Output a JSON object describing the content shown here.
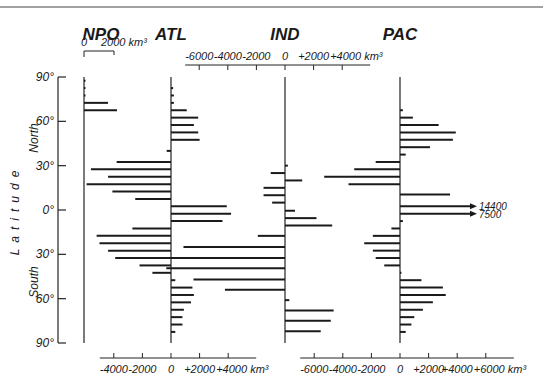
{
  "chart_data": {
    "type": "bar",
    "orientation": "horizontal",
    "title": "",
    "ylabel": "Latitude",
    "ylabel_parts": {
      "north": "North",
      "south": "South"
    },
    "unit": "km³",
    "latitude_ticks": [
      "90°",
      "60°",
      "30°",
      "0°",
      "30°",
      "60°",
      "90°"
    ],
    "latitude_tick_values": [
      90,
      60,
      30,
      0,
      -30,
      -60,
      -90
    ],
    "panels": [
      {
        "name": "NPO",
        "axis_position": "top",
        "axis_ticks": [
          "0",
          "2000 km³"
        ],
        "xlim": [
          0,
          2000
        ],
        "bars": [
          {
            "lat": 87.5,
            "value": 100
          },
          {
            "lat": 82.5,
            "value": 100
          },
          {
            "lat": 77.5,
            "value": 100
          },
          {
            "lat": 72.5,
            "value": 1600
          },
          {
            "lat": 67.5,
            "value": 2200
          }
        ]
      },
      {
        "name": "ATL",
        "axis_position": "bottom",
        "axis_ticks": [
          "-4000",
          "-2000",
          "0",
          "+2000",
          "+4000 km³"
        ],
        "xlim": [
          -4000,
          4000
        ],
        "bars": [
          {
            "lat": 82.5,
            "value": 150
          },
          {
            "lat": 77.5,
            "value": 200
          },
          {
            "lat": 72.5,
            "value": 200
          },
          {
            "lat": 67.5,
            "value": 1100
          },
          {
            "lat": 62.5,
            "value": 1900
          },
          {
            "lat": 57.5,
            "value": 1600
          },
          {
            "lat": 52.5,
            "value": 1900
          },
          {
            "lat": 47.5,
            "value": 2000
          },
          {
            "lat": 40.0,
            "value": -300
          },
          {
            "lat": 32.5,
            "value": -3800
          },
          {
            "lat": 27.5,
            "value": -5600
          },
          {
            "lat": 22.5,
            "value": -4400
          },
          {
            "lat": 17.5,
            "value": -5900
          },
          {
            "lat": 12.5,
            "value": -4100
          },
          {
            "lat": 7.5,
            "value": -2500
          },
          {
            "lat": 2.5,
            "value": 3900
          },
          {
            "lat": -2.5,
            "value": 4200
          },
          {
            "lat": -7.5,
            "value": 3600
          },
          {
            "lat": -12.5,
            "value": -2700
          },
          {
            "lat": -17.5,
            "value": -5200
          },
          {
            "lat": -22.5,
            "value": -5000
          },
          {
            "lat": -27.5,
            "value": -4400
          },
          {
            "lat": -32.5,
            "value": -3900
          },
          {
            "lat": -37.5,
            "value": -2200
          },
          {
            "lat": -42.5,
            "value": -1300
          },
          {
            "lat": -47.5,
            "value": 300
          },
          {
            "lat": -52.5,
            "value": 1500
          },
          {
            "lat": -57.5,
            "value": 1600
          },
          {
            "lat": -62.5,
            "value": 1400
          },
          {
            "lat": -67.5,
            "value": 900
          },
          {
            "lat": -72.5,
            "value": 800
          },
          {
            "lat": -77.5,
            "value": 800
          },
          {
            "lat": -82.5,
            "value": 300
          }
        ]
      },
      {
        "name": "IND",
        "axis_position": "top",
        "axis_ticks": [
          "-6000",
          "-4000",
          "-2000",
          "0",
          "+2000",
          "+4000 km³"
        ],
        "xlim": [
          -6000,
          4000
        ],
        "bars": [
          {
            "lat": 30.0,
            "value": 200
          },
          {
            "lat": 25.0,
            "value": -1000
          },
          {
            "lat": 20.0,
            "value": 1200
          },
          {
            "lat": 15.0,
            "value": -1500
          },
          {
            "lat": 10.0,
            "value": -1500
          },
          {
            "lat": 5.0,
            "value": -900
          },
          {
            "lat": -0.5,
            "value": 700
          },
          {
            "lat": -5.5,
            "value": 2200
          },
          {
            "lat": -10.5,
            "value": 3300
          },
          {
            "lat": -17.5,
            "value": -1900
          },
          {
            "lat": -25.0,
            "value": -7100
          },
          {
            "lat": -32.5,
            "value": -8700
          },
          {
            "lat": -39.5,
            "value": -8300
          },
          {
            "lat": -47.0,
            "value": -6400
          },
          {
            "lat": -54.0,
            "value": -4200
          },
          {
            "lat": -61.0,
            "value": 300
          },
          {
            "lat": -68.0,
            "value": 3400
          },
          {
            "lat": -75.0,
            "value": 3200
          },
          {
            "lat": -82.0,
            "value": 2500
          }
        ]
      },
      {
        "name": "PAC",
        "axis_position": "bottom",
        "axis_ticks": [
          "-6000",
          "-4000",
          "-2000",
          "0",
          "+2000",
          "+4000",
          "+6000 km³"
        ],
        "xlim": [
          -6000,
          6000
        ],
        "annotations": [
          {
            "lat": 2.5,
            "value": 14400,
            "label": "14400"
          },
          {
            "lat": -2.5,
            "value": 7500,
            "label": "7500"
          }
        ],
        "bars": [
          {
            "lat": 67.5,
            "value": 200
          },
          {
            "lat": 62.5,
            "value": 900
          },
          {
            "lat": 57.5,
            "value": 2700
          },
          {
            "lat": 52.5,
            "value": 3900
          },
          {
            "lat": 47.5,
            "value": 3700
          },
          {
            "lat": 42.5,
            "value": 2100
          },
          {
            "lat": 37.5,
            "value": 400
          },
          {
            "lat": 32.5,
            "value": -1700
          },
          {
            "lat": 27.5,
            "value": -3200
          },
          {
            "lat": 22.5,
            "value": -5300
          },
          {
            "lat": 17.5,
            "value": -3600
          },
          {
            "lat": 10.5,
            "value": 3500
          },
          {
            "lat": 2.5,
            "value": 14400
          },
          {
            "lat": -2.5,
            "value": 7500
          },
          {
            "lat": -7.5,
            "value": 200
          },
          {
            "lat": -12.5,
            "value": -600
          },
          {
            "lat": -17.5,
            "value": -1900
          },
          {
            "lat": -22.5,
            "value": -2500
          },
          {
            "lat": -27.5,
            "value": -1900
          },
          {
            "lat": -32.5,
            "value": -1700
          },
          {
            "lat": -37.5,
            "value": -1100
          },
          {
            "lat": -42.5,
            "value": 100
          },
          {
            "lat": -47.5,
            "value": 1500
          },
          {
            "lat": -52.5,
            "value": 3000
          },
          {
            "lat": -57.5,
            "value": 3200
          },
          {
            "lat": -62.5,
            "value": 2300
          },
          {
            "lat": -67.5,
            "value": 1600
          },
          {
            "lat": -72.5,
            "value": 1000
          },
          {
            "lat": -77.5,
            "value": 800
          },
          {
            "lat": -82.5,
            "value": 400
          }
        ]
      }
    ],
    "grid": false,
    "legend": null
  }
}
